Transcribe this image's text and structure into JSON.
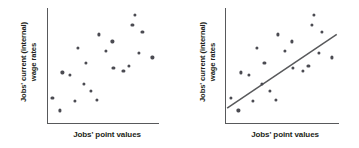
{
  "figure": {
    "background_color": "#ffffff",
    "axis_color": "#58595b",
    "dot_color": "#4b4b52",
    "line_color": "#58595b",
    "text_color": "#231f20"
  },
  "panels": [
    {
      "id": "left",
      "xlabel": "Jobs' point values",
      "ylabel": "Jobs' current (internal)\nwage rates"
    },
    {
      "id": "right",
      "xlabel": "Jobs' point values",
      "ylabel": "Jobs' current (internal)\nwage rates"
    }
  ],
  "chart_data": [
    {
      "type": "scatter",
      "title": "",
      "xlabel": "Jobs' point values",
      "ylabel": "Jobs' current (internal) wage rates",
      "xlim": [
        0,
        100
      ],
      "ylim": [
        0,
        100
      ],
      "grid": false,
      "legend": false,
      "trendline": false,
      "series": [
        {
          "name": "jobs",
          "points": [
            [
              4,
              22
            ],
            [
              11,
              11
            ],
            [
              13,
              44
            ],
            [
              20,
              42
            ],
            [
              24,
              19
            ],
            [
              27,
              65
            ],
            [
              32,
              34
            ],
            [
              34,
              52
            ],
            [
              39,
              28
            ],
            [
              44,
              20
            ],
            [
              46,
              77
            ],
            [
              52,
              63
            ],
            [
              58,
              71
            ],
            [
              59,
              48
            ],
            [
              68,
              45
            ],
            [
              73,
              50
            ],
            [
              76,
              85
            ],
            [
              78,
              94
            ],
            [
              82,
              61
            ],
            [
              85,
              79
            ],
            [
              94,
              57
            ]
          ]
        }
      ]
    },
    {
      "type": "scatter",
      "title": "",
      "xlabel": "Jobs' point values",
      "ylabel": "Jobs' current (internal) wage rates",
      "xlim": [
        0,
        100
      ],
      "ylim": [
        0,
        100
      ],
      "grid": false,
      "legend": false,
      "trendline": true,
      "trendline_points": [
        [
          1,
          13
        ],
        [
          98,
          77
        ]
      ],
      "series": [
        {
          "name": "jobs",
          "points": [
            [
              4,
              22
            ],
            [
              11,
              11
            ],
            [
              13,
              44
            ],
            [
              20,
              42
            ],
            [
              24,
              19
            ],
            [
              27,
              65
            ],
            [
              32,
              34
            ],
            [
              34,
              52
            ],
            [
              39,
              28
            ],
            [
              44,
              20
            ],
            [
              46,
              77
            ],
            [
              52,
              63
            ],
            [
              58,
              71
            ],
            [
              59,
              48
            ],
            [
              68,
              45
            ],
            [
              73,
              50
            ],
            [
              76,
              85
            ],
            [
              78,
              94
            ],
            [
              82,
              61
            ],
            [
              85,
              79
            ],
            [
              94,
              57
            ]
          ]
        }
      ]
    }
  ]
}
